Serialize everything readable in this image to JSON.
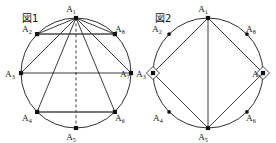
{
  "canvas": {
    "width": 276,
    "height": 143,
    "background": "#ffffff",
    "ink": "#1a1a1a"
  },
  "figures": [
    {
      "id": "figure-1",
      "caption": "図1",
      "caption_x": 22,
      "caption_y": 22,
      "circle": {
        "cx": 76,
        "cy": 73,
        "r": 55
      },
      "vertices": [
        {
          "name": "A1",
          "label": "A",
          "sub": "1",
          "angle_deg": 90,
          "x": 76.0,
          "y": 18.0,
          "marker": "square",
          "label_x": 71.0,
          "label_y": 12.0,
          "label_anchor": "middle"
        },
        {
          "name": "A2",
          "label": "A",
          "sub": "2",
          "angle_deg": 135,
          "x": 37.1,
          "y": 34.1,
          "marker": "square",
          "label_x": 22.0,
          "label_y": 31.5,
          "label_anchor": "start"
        },
        {
          "name": "A3",
          "label": "A",
          "sub": "3",
          "angle_deg": 180,
          "x": 21.0,
          "y": 73.0,
          "marker": "square",
          "label_x": 5.0,
          "label_y": 76.5,
          "label_anchor": "start"
        },
        {
          "name": "A4",
          "label": "A",
          "sub": "4",
          "angle_deg": 225,
          "x": 37.1,
          "y": 111.9,
          "marker": "square",
          "label_x": 22.0,
          "label_y": 120.5,
          "label_anchor": "start"
        },
        {
          "name": "A5",
          "label": "A",
          "sub": "5",
          "angle_deg": 270,
          "x": 76.0,
          "y": 128.0,
          "marker": "square",
          "label_x": 71.0,
          "label_y": 140.0,
          "label_anchor": "middle"
        },
        {
          "name": "A6",
          "label": "A",
          "sub": "6",
          "angle_deg": 315,
          "x": 114.9,
          "y": 111.9,
          "marker": "square",
          "label_x": 115.0,
          "label_y": 120.5,
          "label_anchor": "start"
        },
        {
          "name": "A7",
          "label": "A",
          "sub": "7",
          "angle_deg": 0,
          "x": 131.0,
          "y": 73.0,
          "marker": "square",
          "label_x": 120.0,
          "label_y": 76.5,
          "label_anchor": "start"
        },
        {
          "name": "A8",
          "label": "A",
          "sub": "8",
          "angle_deg": 45,
          "x": 114.9,
          "y": 34.1,
          "marker": "square",
          "label_x": 115.0,
          "label_y": 31.5,
          "label_anchor": "start"
        }
      ],
      "edges": [
        {
          "from": "A1",
          "to": "A2",
          "style": "solid"
        },
        {
          "from": "A1",
          "to": "A3",
          "style": "solid"
        },
        {
          "from": "A1",
          "to": "A4",
          "style": "solid"
        },
        {
          "from": "A1",
          "to": "A5",
          "style": "dashed"
        },
        {
          "from": "A1",
          "to": "A6",
          "style": "solid"
        },
        {
          "from": "A1",
          "to": "A7",
          "style": "solid"
        },
        {
          "from": "A1",
          "to": "A8",
          "style": "solid"
        },
        {
          "from": "A2",
          "to": "A8",
          "style": "heavy"
        },
        {
          "from": "A3",
          "to": "A7",
          "style": "solid"
        },
        {
          "from": "A4",
          "to": "A6",
          "style": "heavy"
        }
      ],
      "angle_marks": []
    },
    {
      "id": "figure-2",
      "caption": "図2",
      "caption_x": 155,
      "caption_y": 22,
      "circle": {
        "cx": 208,
        "cy": 73,
        "r": 55
      },
      "vertices": [
        {
          "name": "A1",
          "label": "A",
          "sub": "1",
          "angle_deg": 90,
          "x": 208.0,
          "y": 18.0,
          "marker": "square",
          "label_x": 203.0,
          "label_y": 12.0,
          "label_anchor": "middle"
        },
        {
          "name": "A2",
          "label": "A",
          "sub": "2",
          "angle_deg": 135,
          "x": 169.1,
          "y": 34.1,
          "marker": "dot",
          "label_x": 152.0,
          "label_y": 31.5,
          "label_anchor": "start"
        },
        {
          "name": "A3",
          "label": "A",
          "sub": "3",
          "angle_deg": 180,
          "x": 153.0,
          "y": 73.0,
          "marker": "square",
          "label_x": 136.0,
          "label_y": 76.5,
          "label_anchor": "start"
        },
        {
          "name": "A4",
          "label": "A",
          "sub": "4",
          "angle_deg": 225,
          "x": 169.1,
          "y": 111.9,
          "marker": "dot",
          "label_x": 153.0,
          "label_y": 120.5,
          "label_anchor": "start"
        },
        {
          "name": "A5",
          "label": "A",
          "sub": "5",
          "angle_deg": 270,
          "x": 208.0,
          "y": 128.0,
          "marker": "square",
          "label_x": 203.0,
          "label_y": 140.0,
          "label_anchor": "middle"
        },
        {
          "name": "A6",
          "label": "A",
          "sub": "6",
          "angle_deg": 315,
          "x": 246.9,
          "y": 111.9,
          "marker": "dot",
          "label_x": 246.0,
          "label_y": 120.5,
          "label_anchor": "start"
        },
        {
          "name": "A7",
          "label": "A",
          "sub": "7",
          "angle_deg": 0,
          "x": 263.0,
          "y": 73.0,
          "marker": "square",
          "label_x": 252.0,
          "label_y": 76.5,
          "label_anchor": "start"
        },
        {
          "name": "A8",
          "label": "A",
          "sub": "8",
          "angle_deg": 45,
          "x": 246.9,
          "y": 34.1,
          "marker": "dot",
          "label_x": 246.0,
          "label_y": 31.5,
          "label_anchor": "start"
        }
      ],
      "edges": [
        {
          "from": "A1",
          "to": "A3",
          "style": "solid"
        },
        {
          "from": "A3",
          "to": "A5",
          "style": "solid"
        },
        {
          "from": "A5",
          "to": "A7",
          "style": "solid"
        },
        {
          "from": "A7",
          "to": "A1",
          "style": "solid"
        },
        {
          "from": "A1",
          "to": "A5",
          "style": "solid"
        }
      ],
      "angle_marks": [
        {
          "at": "A3",
          "size": 6.5
        },
        {
          "at": "A7",
          "size": 6.5
        }
      ]
    }
  ]
}
